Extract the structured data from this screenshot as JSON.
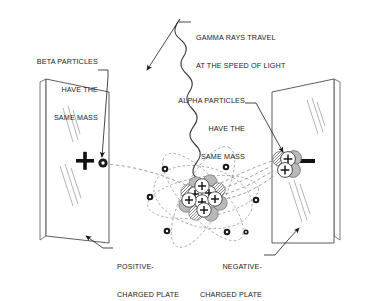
{
  "diagram": {
    "type": "physics-illustration",
    "colors": {
      "ink": "#1a1a1a",
      "line": "#3a3a3a",
      "glass": "#8a8a94",
      "dash": "#8e8e8e",
      "neutron_fill": "#b9b9b9",
      "proton_fill": "#ffffff",
      "background": "#ffffff"
    }
  },
  "labels": {
    "gamma": {
      "line1": "GAMMA RAYS TRAVEL",
      "line2": "AT THE SPEED OF LIGHT"
    },
    "beta": {
      "line1": "BETA PARTICLES",
      "line2": "HAVE THE",
      "line3": "SAME MASS"
    },
    "alpha": {
      "line1": "ALPHA PARTICLES",
      "line2": "HAVE THE",
      "line3": "SAME MASS"
    },
    "positive_plate": {
      "line1": "POSITIVE-",
      "line2": "CHARGED PLATE"
    },
    "negative_plate": {
      "line1": "NEGATIVE-",
      "line2": "CHARGED PLATE"
    }
  },
  "plates": {
    "left": {
      "charge_symbol": "+",
      "polarity": "positive"
    },
    "right": {
      "charge_symbol": "−",
      "polarity": "negative"
    }
  },
  "particles": {
    "beta": {
      "name": "beta-particle",
      "charge": "negative",
      "count": 1
    },
    "alpha": {
      "name": "alpha-particle",
      "protons": 2,
      "neutrons": 2
    },
    "gamma": {
      "name": "gamma-ray",
      "charge": "neutral"
    },
    "electrons_in_orbit": 7,
    "nucleus": {
      "protons_visible": 7,
      "neutrons_visible": 8
    }
  }
}
